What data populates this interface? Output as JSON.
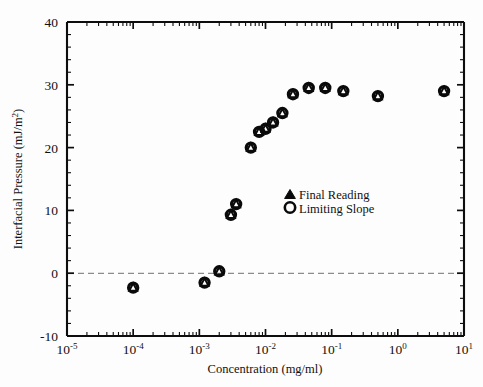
{
  "chart_data": {
    "type": "scatter",
    "title": "",
    "xlabel": "Concentration (mg/ml)",
    "ylabel": "Interfacial Pressure (mJ/m²)",
    "xscale": "log",
    "yscale": "linear",
    "xlim": [
      1e-05,
      10
    ],
    "ylim": [
      -10,
      40
    ],
    "grid": false,
    "legend_position": "center-right",
    "x_tick_labels": [
      "10-5",
      "10-4",
      "10-3",
      "10-2",
      "10-1",
      "100",
      "101"
    ],
    "x_tick_mantissa": "10",
    "x_tick_exponents": [
      "-5",
      "-4",
      "-3",
      "-2",
      "-1",
      "0",
      "1"
    ],
    "x_tick_values": [
      1e-05,
      0.0001,
      0.001,
      0.01,
      0.1,
      1,
      10
    ],
    "y_tick_labels": [
      "-10",
      "0",
      "10",
      "20",
      "30",
      "40"
    ],
    "y_tick_values": [
      -10,
      0,
      10,
      20,
      30,
      40
    ],
    "annotations": [
      {
        "name": "zero-reference-line",
        "type": "hline",
        "y": 0,
        "style": "dashed",
        "color": "#8c8c8c"
      }
    ],
    "series": [
      {
        "name": "Final Reading",
        "marker": "triangle",
        "legend_label": "Final Reading",
        "x": [
          0.0001,
          0.0012,
          0.002,
          0.003,
          0.0036,
          0.006,
          0.008,
          0.01,
          0.013,
          0.018,
          0.026,
          0.045,
          0.08,
          0.15,
          0.5,
          5.0
        ],
        "y": [
          -2.3,
          -1.5,
          0.3,
          9.3,
          11.0,
          20.0,
          22.5,
          23.0,
          24.0,
          25.5,
          28.5,
          29.5,
          29.5,
          29.0,
          28.2,
          29.0
        ]
      },
      {
        "name": "Limiting Slope",
        "marker": "circle",
        "legend_label": "Limiting Slope",
        "x": [
          0.0001,
          0.0012,
          0.002,
          0.003,
          0.0036,
          0.006,
          0.008,
          0.01,
          0.013,
          0.018,
          0.026,
          0.045,
          0.08,
          0.15,
          0.5,
          5.0
        ],
        "y": [
          -2.3,
          -1.5,
          0.3,
          9.3,
          11.0,
          20.0,
          22.5,
          23.0,
          24.0,
          25.5,
          28.5,
          29.5,
          29.5,
          29.0,
          28.2,
          29.0
        ]
      }
    ]
  },
  "axes": {
    "y_title_main": "Interfacial Pressure (mJ/m",
    "y_title_sup": "2",
    "y_title_close": ")",
    "x_title": "Concentration (mg/ml)"
  },
  "legend": {
    "entries": [
      {
        "symbol": "triangle-marker",
        "label": "Final Reading"
      },
      {
        "symbol": "circle-marker",
        "label": "Limiting Slope"
      }
    ]
  },
  "colors": {
    "axis": "#0d0d0d",
    "marker": "#0a0a0a",
    "zero_line": "#8c8c8c",
    "background": "#fdfdfd"
  }
}
